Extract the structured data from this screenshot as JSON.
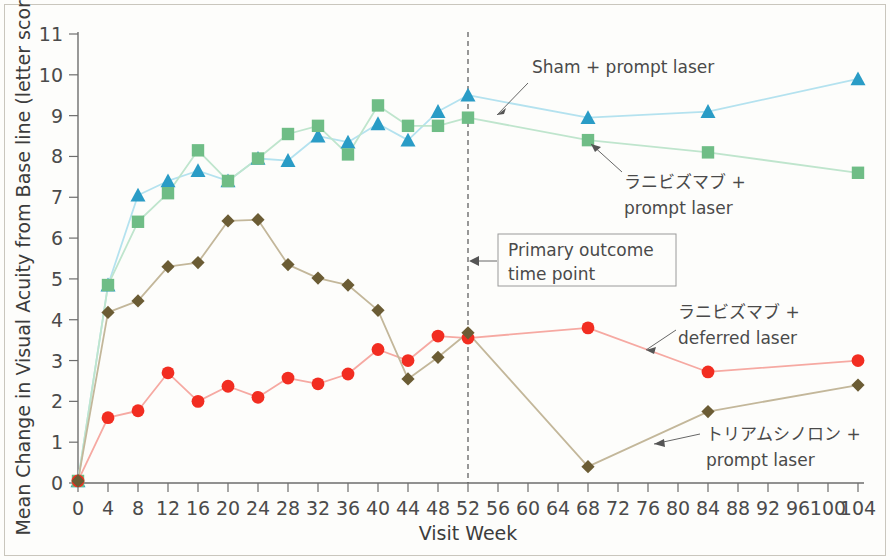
{
  "chart_data": {
    "type": "line",
    "title": "",
    "xlabel": "Visit Week",
    "ylabel": "Mean Change in Visual Acuity from Base line (letter score)",
    "xlim": [
      0,
      104
    ],
    "ylim": [
      0,
      11
    ],
    "xticks": [
      0,
      4,
      8,
      12,
      16,
      20,
      24,
      28,
      32,
      36,
      40,
      44,
      48,
      52,
      56,
      60,
      64,
      68,
      72,
      76,
      80,
      84,
      88,
      92,
      96,
      100,
      104
    ],
    "yticks": [
      0,
      1,
      2,
      3,
      4,
      5,
      6,
      7,
      8,
      9,
      10,
      11
    ],
    "grid": false,
    "legend_position": "inline-annotations",
    "annotations": [
      {
        "name": "primary-outcome",
        "text_line1": "Primary outcome",
        "text_line2": "time point",
        "at_week": 52
      },
      {
        "name": "sham-prompt-laser",
        "text": "Sham + prompt laser"
      },
      {
        "name": "ranibizumab-prompt-laser",
        "text_line1": "ラニビズマブ +",
        "text_line2": "prompt laser"
      },
      {
        "name": "ranibizumab-deferred-laser",
        "text_line1": "ラニビズマブ +",
        "text_line2": "deferred laser"
      },
      {
        "name": "triamcinolone-prompt-laser",
        "text_line1": "トリアムシノロン +",
        "text_line2": "prompt laser"
      }
    ],
    "series": [
      {
        "name": "Sham + prompt laser",
        "marker": "triangle",
        "color": "#2a9cc6",
        "line_color": "#b4e2ef",
        "x": [
          0,
          4,
          8,
          12,
          16,
          20,
          24,
          28,
          32,
          36,
          40,
          44,
          48,
          52,
          68,
          84,
          104
        ],
        "values": [
          0.05,
          4.85,
          7.05,
          7.4,
          7.65,
          7.4,
          7.95,
          7.9,
          8.5,
          8.35,
          8.8,
          8.4,
          9.1,
          9.5,
          8.95,
          9.1,
          9.9
        ]
      },
      {
        "name": "ラニビズマブ + prompt laser",
        "marker": "square",
        "color": "#6fbd86",
        "line_color": "#bfe5cd",
        "x": [
          0,
          4,
          8,
          12,
          16,
          20,
          24,
          28,
          32,
          36,
          40,
          44,
          48,
          52,
          68,
          84,
          104
        ],
        "values": [
          0.05,
          4.85,
          6.4,
          7.1,
          8.15,
          7.4,
          7.95,
          8.55,
          8.75,
          8.05,
          9.25,
          8.75,
          8.75,
          8.95,
          8.4,
          8.1,
          7.6
        ]
      },
      {
        "name": "ラニビズマブ + deferred laser",
        "marker": "circle",
        "color": "#f22d21",
        "line_color": "#f6a9a2",
        "x": [
          0,
          4,
          8,
          12,
          16,
          20,
          24,
          28,
          32,
          36,
          40,
          44,
          48,
          52,
          68,
          84,
          104
        ],
        "values": [
          0.05,
          1.6,
          1.77,
          2.7,
          2.0,
          2.37,
          2.1,
          2.57,
          2.43,
          2.67,
          3.27,
          3.0,
          3.6,
          3.55,
          3.8,
          2.72,
          3.0
        ]
      },
      {
        "name": "トリアムシノロン + prompt laser",
        "marker": "diamond",
        "color": "#6b5c34",
        "line_color": "#c3b79a",
        "x": [
          0,
          4,
          8,
          12,
          16,
          20,
          24,
          28,
          32,
          36,
          40,
          44,
          48,
          52,
          68,
          84,
          104
        ],
        "values": [
          0.05,
          4.18,
          4.46,
          5.3,
          5.4,
          6.42,
          6.45,
          5.35,
          5.02,
          4.85,
          4.23,
          2.55,
          3.08,
          3.68,
          0.4,
          1.75,
          2.4
        ]
      }
    ]
  }
}
